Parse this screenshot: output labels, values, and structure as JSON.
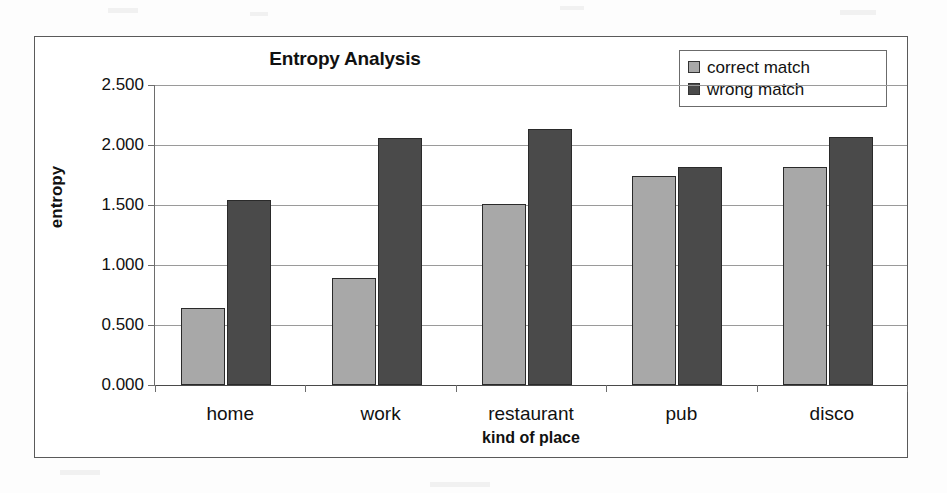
{
  "chart_data": {
    "type": "bar",
    "title": "Entropy Analysis",
    "xlabel": "kind of place",
    "ylabel": "entropy",
    "categories": [
      "home",
      "work",
      "restaurant",
      "pub",
      "disco"
    ],
    "series": [
      {
        "name": "correct match",
        "color": "#a8a8a8",
        "values": [
          0.64,
          0.89,
          1.51,
          1.74,
          1.82
        ]
      },
      {
        "name": "wrong match",
        "color": "#4a4a4a",
        "values": [
          1.54,
          2.06,
          2.13,
          1.82,
          2.07
        ]
      }
    ],
    "ylim": [
      0,
      2.5
    ],
    "ytick_labels": [
      "2.500",
      "2.000",
      "1.500",
      "1.000",
      "0.500",
      "0.000"
    ],
    "ytick_values": [
      2.5,
      2.0,
      1.5,
      1.0,
      0.5,
      0.0
    ],
    "grid": true,
    "legend_position": "top-right"
  },
  "legend": {
    "items": [
      {
        "label": "correct match",
        "color": "#a8a8a8"
      },
      {
        "label": "wrong match",
        "color": "#4a4a4a"
      }
    ]
  }
}
